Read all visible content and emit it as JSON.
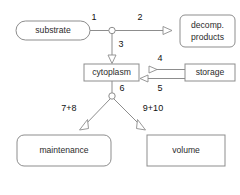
{
  "diagram": {
    "background_color": "#ffffff",
    "line_color": "#8d8d8d",
    "text_color": "#2b2b2b",
    "nodes": [
      {
        "id": "substrate",
        "label": "substrate",
        "shape": "pill",
        "x": 16,
        "y": 21,
        "w": 74,
        "h": 19
      },
      {
        "id": "decomp",
        "label_line1": "decomp.",
        "label_line2": "products",
        "shape": "rounded",
        "x": 180,
        "y": 15,
        "w": 55,
        "h": 32
      },
      {
        "id": "cytoplasm",
        "label": "cytoplasm",
        "shape": "rect",
        "x": 84,
        "y": 64,
        "w": 55,
        "h": 17
      },
      {
        "id": "storage",
        "label": "storage",
        "shape": "rect",
        "x": 185,
        "y": 64,
        "w": 50,
        "h": 17
      },
      {
        "id": "maintenance",
        "label": "maintenance",
        "shape": "rounded",
        "x": 17,
        "y": 135,
        "w": 94,
        "h": 31
      },
      {
        "id": "volume",
        "label": "volume",
        "shape": "rect",
        "x": 147,
        "y": 135,
        "w": 78,
        "h": 31
      }
    ],
    "flux_labels": [
      {
        "id": "flux-1",
        "text": "1",
        "x": 94,
        "y": 18
      },
      {
        "id": "flux-2",
        "text": "2",
        "x": 140,
        "y": 18
      },
      {
        "id": "flux-3",
        "text": "3",
        "x": 121,
        "y": 44
      },
      {
        "id": "flux-4",
        "text": "4",
        "x": 160,
        "y": 60
      },
      {
        "id": "flux-5",
        "text": "5",
        "x": 160,
        "y": 88
      },
      {
        "id": "flux-6",
        "text": "6",
        "x": 121,
        "y": 90
      },
      {
        "id": "flux-7-8",
        "text": "7+8",
        "x": 69,
        "y": 108
      },
      {
        "id": "flux-9-10",
        "text": "9+10",
        "x": 152,
        "y": 108
      }
    ],
    "junctions": [
      {
        "id": "junction-upper",
        "cx": 112,
        "cy": 30,
        "r": 3.2
      },
      {
        "id": "junction-lower",
        "cx": 112,
        "cy": 96,
        "r": 3.2
      }
    ],
    "edges": [
      {
        "id": "edge-substrate-to-junction",
        "from": "substrate",
        "to": "junction-upper",
        "flux": "1",
        "arrow": false
      },
      {
        "id": "edge-junction-to-decomp",
        "from": "junction-upper",
        "to": "decomp",
        "flux": "2",
        "arrow": true
      },
      {
        "id": "edge-junction-to-cytoplasm",
        "from": "junction-upper",
        "to": "cytoplasm",
        "flux": "3",
        "arrow": true
      },
      {
        "id": "edge-cytoplasm-to-storage",
        "from": "cytoplasm",
        "to": "storage",
        "flux": "4",
        "arrow": true
      },
      {
        "id": "edge-storage-to-cytoplasm",
        "from": "storage",
        "to": "cytoplasm",
        "flux": "5",
        "arrow": true
      },
      {
        "id": "edge-cytoplasm-to-junction",
        "from": "cytoplasm",
        "to": "junction-lower",
        "flux": "6",
        "arrow": false
      },
      {
        "id": "edge-junction-to-maintenance",
        "from": "junction-lower",
        "to": "maintenance",
        "flux": "7+8",
        "arrow": true
      },
      {
        "id": "edge-junction-to-volume",
        "from": "junction-lower",
        "to": "volume",
        "flux": "9+10",
        "arrow": true
      }
    ]
  }
}
